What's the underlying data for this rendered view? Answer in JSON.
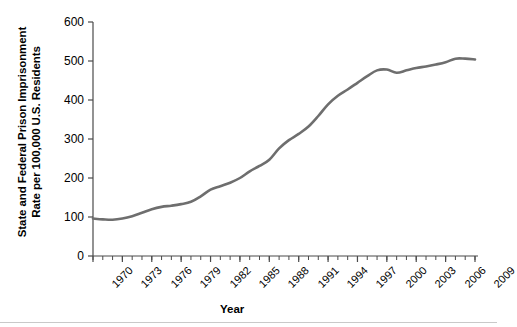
{
  "chart_data": {
    "type": "line",
    "title": "",
    "xlabel": "Year",
    "ylabel": "State and Federal Prison Imprisonment\nRate per 100,000 U.S. Residents",
    "xlim": [
      1970,
      2009
    ],
    "ylim": [
      0,
      600
    ],
    "y_ticks": [
      0,
      100,
      200,
      300,
      400,
      500,
      600
    ],
    "y_tick_labels": [
      "0",
      "100",
      "200",
      "300",
      "400",
      "500",
      "600"
    ],
    "x_tick_labels": [
      "1970",
      "1973",
      "1976",
      "1979",
      "1982",
      "1985",
      "1988",
      "1991",
      "1994",
      "1997",
      "2000",
      "2003",
      "2006",
      "2009"
    ],
    "x_tick_step_years": 3,
    "x_minor_tick_step_years": 1,
    "grid": false,
    "legend": null,
    "line_color": "#6e6e6e",
    "line_width": 2.6,
    "x": [
      1970,
      1971,
      1972,
      1973,
      1974,
      1975,
      1976,
      1977,
      1978,
      1979,
      1980,
      1981,
      1982,
      1983,
      1984,
      1985,
      1986,
      1987,
      1988,
      1989,
      1990,
      1991,
      1992,
      1993,
      1994,
      1995,
      1996,
      1997,
      1998,
      1999,
      2000,
      2001,
      2002,
      2003,
      2004,
      2005,
      2006,
      2007,
      2008,
      2009
    ],
    "values": [
      96,
      94,
      93,
      96,
      102,
      111,
      120,
      126,
      129,
      133,
      139,
      153,
      170,
      179,
      188,
      200,
      217,
      231,
      247,
      276,
      297,
      313,
      332,
      359,
      389,
      411,
      427,
      444,
      461,
      476,
      478,
      470,
      476,
      482,
      486,
      491,
      497,
      506,
      506,
      504
    ],
    "annotations": []
  }
}
